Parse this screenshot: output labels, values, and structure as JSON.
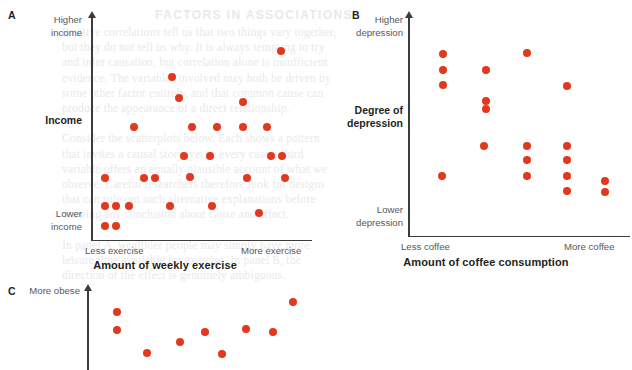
{
  "figure": {
    "background_color": "#ffffff",
    "dot_color": "#e2391e",
    "axis_color": "#3c3c3c"
  },
  "ghost_text": {
    "heading": "FACTORS IN ASSOCIATIONS",
    "lines": [
      "Positive correlations tell us that two things vary together,",
      "but they do not tell us why. It is always tempting to try",
      "and infer causation, but correlation alone is insufficient",
      "evidence. The variables involved may both be driven by",
      "some other factor entirely, and that common cause can",
      "produce the appearance of a direct relationship.",
      "",
      "Consider the scatterplots below. Each shows a pattern",
      "that invites a causal story, yet in every case a third",
      "variable offers an equally plausible account of what we",
      "observe. Careful researchers therefore look for designs",
      "that can rule out such alternative explanations before",
      "drawing any conclusion about cause and effect.",
      "",
      "In panel A, wealthier people may simply have more",
      "leisure time available for exercise. In panel B, the",
      "direction of the effect is genuinely ambiguous."
    ]
  },
  "panels": [
    {
      "id": "A",
      "letter": "A",
      "y_axis_top_label": "Higher\nincome",
      "y_axis_bottom_label": "Lower\nincome",
      "y_axis_title": "Income",
      "x_axis_left_label": "Less exercise",
      "x_axis_right_label": "More exercise",
      "x_axis_title": "Amount of weekly exercise",
      "chart_data": {
        "type": "scatter",
        "title": "",
        "xlabel": "Amount of weekly exercise",
        "ylabel": "Income",
        "xticklabels": [
          "Less exercise",
          "More exercise"
        ],
        "yticklabels": [
          "Lower income",
          "Higher income"
        ],
        "grid": false,
        "legend": "none",
        "xlim": [
          0,
          1
        ],
        "ylim": [
          0,
          1
        ],
        "points": [
          {
            "x": 0.06,
            "y": 0.05
          },
          {
            "x": 0.11,
            "y": 0.05
          },
          {
            "x": 0.06,
            "y": 0.15
          },
          {
            "x": 0.11,
            "y": 0.15
          },
          {
            "x": 0.165,
            "y": 0.15
          },
          {
            "x": 0.35,
            "y": 0.15
          },
          {
            "x": 0.54,
            "y": 0.15
          },
          {
            "x": 0.75,
            "y": 0.117
          },
          {
            "x": 0.06,
            "y": 0.29
          },
          {
            "x": 0.235,
            "y": 0.29
          },
          {
            "x": 0.285,
            "y": 0.29
          },
          {
            "x": 0.44,
            "y": 0.295
          },
          {
            "x": 0.7,
            "y": 0.29
          },
          {
            "x": 0.87,
            "y": 0.29
          },
          {
            "x": 0.415,
            "y": 0.4
          },
          {
            "x": 0.53,
            "y": 0.4
          },
          {
            "x": 0.805,
            "y": 0.4
          },
          {
            "x": 0.855,
            "y": 0.4
          },
          {
            "x": 0.19,
            "y": 0.545
          },
          {
            "x": 0.45,
            "y": 0.545
          },
          {
            "x": 0.565,
            "y": 0.545
          },
          {
            "x": 0.68,
            "y": 0.545
          },
          {
            "x": 0.79,
            "y": 0.545
          },
          {
            "x": 0.39,
            "y": 0.69
          },
          {
            "x": 0.68,
            "y": 0.67
          },
          {
            "x": 0.36,
            "y": 0.795
          },
          {
            "x": 0.85,
            "y": 0.925
          }
        ]
      }
    },
    {
      "id": "B",
      "letter": "B",
      "y_axis_top_label": "Higher\ndepression",
      "y_axis_bottom_label": "Lower\ndepression",
      "y_axis_title": "Degree of\ndepression",
      "x_axis_left_label": "Less coffee",
      "x_axis_right_label": "More coffee",
      "x_axis_title": "Amount of coffee consumption",
      "chart_data": {
        "type": "scatter",
        "title": "",
        "xlabel": "Amount of coffee consumption",
        "ylabel": "Degree of depression",
        "xticklabels": [
          "Less coffee",
          "More coffee"
        ],
        "yticklabels": [
          "Lower depression",
          "Higher depression"
        ],
        "grid": false,
        "legend": "none",
        "xlim": [
          0,
          1
        ],
        "ylim": [
          0,
          1
        ],
        "points": [
          {
            "x": 0.155,
            "y": 0.91
          },
          {
            "x": 0.155,
            "y": 0.825
          },
          {
            "x": 0.155,
            "y": 0.75
          },
          {
            "x": 0.345,
            "y": 0.825
          },
          {
            "x": 0.53,
            "y": 0.915
          },
          {
            "x": 0.345,
            "y": 0.67
          },
          {
            "x": 0.345,
            "y": 0.63
          },
          {
            "x": 0.71,
            "y": 0.745
          },
          {
            "x": 0.34,
            "y": 0.44
          },
          {
            "x": 0.53,
            "y": 0.44
          },
          {
            "x": 0.71,
            "y": 0.44
          },
          {
            "x": 0.53,
            "y": 0.365
          },
          {
            "x": 0.71,
            "y": 0.365
          },
          {
            "x": 0.15,
            "y": 0.285
          },
          {
            "x": 0.53,
            "y": 0.285
          },
          {
            "x": 0.71,
            "y": 0.285
          },
          {
            "x": 0.885,
            "y": 0.26
          },
          {
            "x": 0.71,
            "y": 0.21
          },
          {
            "x": 0.885,
            "y": 0.205
          }
        ]
      }
    },
    {
      "id": "C",
      "letter": "C",
      "y_axis_top_label": "More obese",
      "chart_data": {
        "type": "scatter",
        "title": "",
        "xlabel": "",
        "ylabel": "More obese",
        "xticklabels": [],
        "yticklabels": [
          "More obese"
        ],
        "grid": false,
        "legend": "none",
        "xlim": [
          0,
          1
        ],
        "ylim": [
          0,
          1
        ],
        "points": [
          {
            "x": 0.14,
            "y": 0.76
          },
          {
            "x": 0.14,
            "y": 0.52
          },
          {
            "x": 0.28,
            "y": 0.23
          },
          {
            "x": 0.44,
            "y": 0.37
          },
          {
            "x": 0.555,
            "y": 0.505
          },
          {
            "x": 0.64,
            "y": 0.215
          },
          {
            "x": 0.75,
            "y": 0.545
          },
          {
            "x": 0.88,
            "y": 0.505
          },
          {
            "x": 0.975,
            "y": 0.89
          }
        ]
      }
    }
  ]
}
